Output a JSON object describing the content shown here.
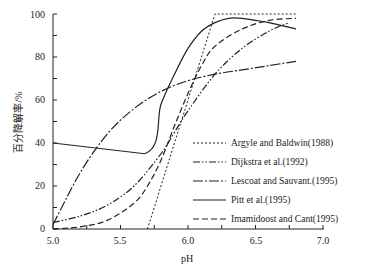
{
  "chart_data": {
    "type": "line",
    "title": "",
    "xlabel": "pH",
    "ylabel": "百分降解率/%",
    "xlim": [
      5.0,
      7.0
    ],
    "ylim": [
      0,
      100
    ],
    "x_ticks": [
      "5.0",
      "5.5",
      "6.0",
      "6.5",
      "7.0"
    ],
    "y_ticks": [
      "0",
      "20",
      "40",
      "60",
      "80",
      "100"
    ],
    "grid": false,
    "legend_position": "lower right",
    "series": [
      {
        "name": "Argyle and Baldwin(1988)",
        "style": "dotted",
        "points": [
          [
            5.7,
            0
          ],
          [
            6.2,
            100
          ],
          [
            6.8,
            100
          ]
        ]
      },
      {
        "name": "Dijkstra et al.(1992)",
        "style": "dash-dot-dot",
        "points": [
          [
            5.0,
            3
          ],
          [
            5.2,
            6
          ],
          [
            5.4,
            11
          ],
          [
            5.6,
            20
          ],
          [
            5.8,
            35
          ],
          [
            5.9,
            45
          ],
          [
            6.0,
            55
          ],
          [
            6.2,
            72
          ],
          [
            6.4,
            84
          ],
          [
            6.6,
            92
          ],
          [
            6.75,
            96
          ]
        ]
      },
      {
        "name": "Lescoat and Sauvant.(1995)",
        "style": "dash-dot",
        "points": [
          [
            5.0,
            2
          ],
          [
            5.2,
            26
          ],
          [
            5.4,
            44
          ],
          [
            5.6,
            56
          ],
          [
            5.8,
            64
          ],
          [
            6.0,
            69
          ],
          [
            6.2,
            72
          ],
          [
            6.4,
            74
          ],
          [
            6.6,
            76
          ],
          [
            6.8,
            78
          ]
        ]
      },
      {
        "name": "Pitt et al.(1995)",
        "style": "solid",
        "points": [
          [
            5.0,
            40
          ],
          [
            5.68,
            35
          ],
          [
            5.8,
            58
          ],
          [
            5.9,
            72
          ],
          [
            6.0,
            84
          ],
          [
            6.1,
            92
          ],
          [
            6.2,
            96
          ],
          [
            6.3,
            98
          ],
          [
            6.4,
            98
          ],
          [
            6.5,
            97
          ],
          [
            6.6,
            96
          ],
          [
            6.8,
            93
          ]
        ]
      },
      {
        "name": "Imamidoost and Cant(1995)",
        "style": "dashed",
        "points": [
          [
            5.0,
            0
          ],
          [
            5.2,
            1
          ],
          [
            5.4,
            4
          ],
          [
            5.6,
            12
          ],
          [
            5.7,
            20
          ],
          [
            5.8,
            32
          ],
          [
            5.9,
            48
          ],
          [
            6.0,
            63
          ],
          [
            6.1,
            76
          ],
          [
            6.2,
            85
          ],
          [
            6.4,
            93
          ],
          [
            6.6,
            97
          ],
          [
            6.8,
            98
          ]
        ]
      }
    ]
  },
  "axes": {
    "xlabel": "pH",
    "ylabel": "百分降解率/%",
    "x_ticks": [
      "5.0",
      "5.5",
      "6.0",
      "6.5",
      "7.0"
    ],
    "y_ticks": [
      "0",
      "20",
      "40",
      "60",
      "80",
      "100"
    ]
  },
  "legend": [
    "Argyle and Baldwin(1988)",
    "Dijkstra et al.(1992)",
    "Lescoat and Sauvant.(1995)",
    "Pitt et al.(1995)",
    "Imamidoost and Cant(1995)"
  ]
}
